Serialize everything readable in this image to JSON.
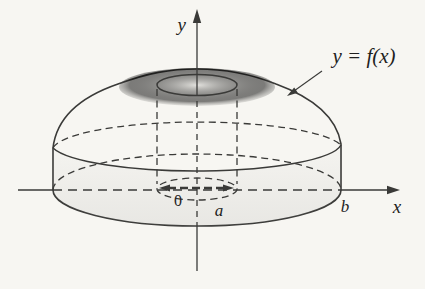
{
  "figure": {
    "type": "solid-of-revolution-diagram",
    "axis_labels": {
      "y": "y",
      "x": "x"
    },
    "point_labels": {
      "origin": "0",
      "inner_radius": "a",
      "outer_radius": "b"
    },
    "curve_label": "y = f(x)",
    "colors": {
      "background": "#f7f6f2",
      "solid_light": "#d8d7d3",
      "solid_dark": "#b7b7b5",
      "hole_dark": "#a6a6a4",
      "line": "#3a3a38",
      "text": "#1f1f1e"
    }
  }
}
